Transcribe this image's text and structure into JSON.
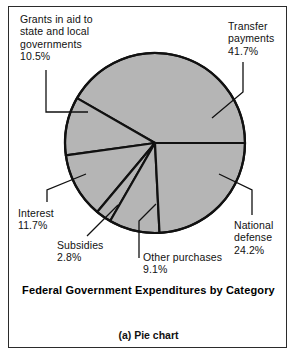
{
  "figure": {
    "title": "Federal Government Expenditures by Category",
    "caption": "(a) Pie chart",
    "frame": {
      "border_color": "#2b2b2b",
      "background": "#ffffff"
    }
  },
  "chart_data": {
    "type": "pie",
    "title": "Federal Government Expenditures by Category",
    "subtitle": "(a) Pie chart",
    "xlabel": "",
    "ylabel": "",
    "units": "percent",
    "total": 100.0,
    "legend_position": "none",
    "labels_outside": true,
    "grid": false,
    "geometry": {
      "center_x": 155,
      "center_y": 143,
      "radius": 90,
      "start_angle_deg": 0,
      "direction": "counterclockwise",
      "fill": "#b5b5b5",
      "stroke": "#111111",
      "stroke_width": 2.2
    },
    "categories": [
      "Transfer payments",
      "Grants in aid to state and local governments",
      "Interest",
      "Subsidies",
      "Other purchases",
      "National defense"
    ],
    "values": [
      41.7,
      10.5,
      11.7,
      2.8,
      9.1,
      24.2
    ],
    "slices": [
      {
        "label": "Transfer payments",
        "value": 41.7,
        "value_text": "41.7%"
      },
      {
        "label": "Grants in aid to state and local governments",
        "value": 10.5,
        "value_text": "10.5%"
      },
      {
        "label": "Interest",
        "value": 11.7,
        "value_text": "11.7%"
      },
      {
        "label": "Subsidies",
        "value": 2.8,
        "value_text": "2.8%"
      },
      {
        "label": "Other purchases",
        "value": 9.1,
        "value_text": "9.1%"
      },
      {
        "label": "National defense",
        "value": 24.2,
        "value_text": "24.2%"
      }
    ]
  },
  "labels": {
    "grants": {
      "line1": "Grants in aid to",
      "line2": "state and local",
      "line3": "governments",
      "pct": "10.5%"
    },
    "transfer": {
      "line1": "Transfer",
      "line2": "payments",
      "pct": "41.7%"
    },
    "interest": {
      "line1": "Interest",
      "pct": "11.7%"
    },
    "subsidies": {
      "line1": "Subsidies",
      "pct": "2.8%"
    },
    "other": {
      "line1": "Other purchases",
      "pct": "9.1%"
    },
    "defense": {
      "line1": "National",
      "line2": "defense",
      "pct": "24.2%"
    }
  }
}
